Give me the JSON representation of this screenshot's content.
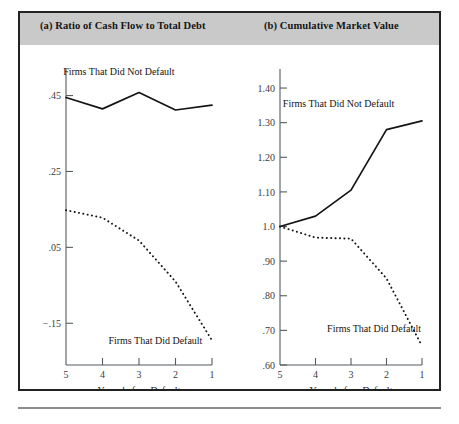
{
  "figure": {
    "panel_a_title": "(a) Ratio of Cash Flow to Total Debt",
    "panel_b_title": "(b) Cumulative Market Value"
  },
  "chart_data": [
    {
      "type": "line",
      "title": "(a) Ratio of Cash Flow to Total Debt",
      "xlabel": "Years before Default",
      "ylabel": "",
      "x": [
        5,
        4,
        3,
        2,
        1
      ],
      "xticklabels": [
        "5",
        "4",
        "3",
        "2",
        "1"
      ],
      "yticks": [
        0.45,
        0.25,
        0.05,
        -0.15
      ],
      "yticklabels": [
        ".45",
        ".25",
        ".05",
        "−.15"
      ],
      "ylim": [
        -0.26,
        0.52
      ],
      "xlim": [
        5,
        1
      ],
      "grid": false,
      "legend": "inline-annotations",
      "series": [
        {
          "name": "Firms That Did Not Default",
          "style": "solid",
          "label_x": 3.55,
          "label_y": 0.505,
          "values": [
            0.445,
            0.415,
            0.458,
            0.412,
            0.425
          ]
        },
        {
          "name": "Firms That Did Default",
          "style": "dotted",
          "label_x": 2.55,
          "label_y": -0.205,
          "values": [
            0.148,
            0.128,
            0.068,
            -0.04,
            -0.195
          ]
        }
      ]
    },
    {
      "type": "line",
      "title": "(b) Cumulative Market Value",
      "xlabel": "Years before Default",
      "ylabel": "",
      "x": [
        5,
        4,
        3,
        2,
        1
      ],
      "xticklabels": [
        "5",
        "4",
        "3",
        "2",
        "1"
      ],
      "yticks": [
        1.4,
        1.3,
        1.2,
        1.1,
        1.0,
        0.9,
        0.8,
        0.7,
        0.6
      ],
      "yticklabels": [
        "1.40",
        "1.30",
        "1.20",
        "1.10",
        "1.0",
        ".90",
        ".80",
        ".70",
        ".60"
      ],
      "ylim": [
        0.6,
        1.455
      ],
      "xlim": [
        5,
        1
      ],
      "grid": false,
      "legend": "inline-annotations",
      "series": [
        {
          "name": "Firms That Did Not Default",
          "style": "solid",
          "label_x": 3.35,
          "label_y": 1.345,
          "values": [
            1.0,
            1.03,
            1.105,
            1.28,
            1.305
          ]
        },
        {
          "name": "Firms That Did Default",
          "style": "dotted",
          "label_x": 2.35,
          "label_y": 0.695,
          "values": [
            1.0,
            0.968,
            0.965,
            0.85,
            0.655
          ]
        }
      ]
    }
  ]
}
